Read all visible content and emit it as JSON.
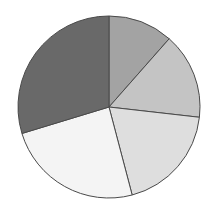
{
  "chart_data": {
    "type": "pie",
    "title": "",
    "categories": [
      "Slice 1",
      "Slice 2",
      "Slice 3",
      "Slice 4",
      "Slice 5"
    ],
    "values": [
      11.5,
      15.3,
      19.1,
      24.4,
      29.7
    ],
    "colors": [
      "#a3a3a3",
      "#c4c4c4",
      "#dedede",
      "#f4f4f4",
      "#696969"
    ],
    "start_angle_deg": 0,
    "direction": "clockwise",
    "legend": "none",
    "stroke_color": "#4a4a4a"
  }
}
